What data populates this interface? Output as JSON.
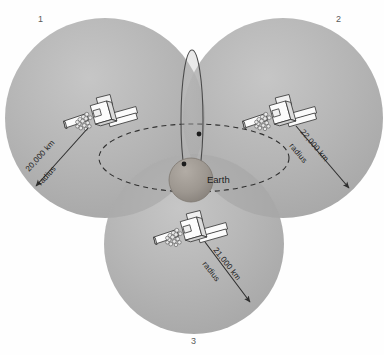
{
  "figure": {
    "background_color": "#fefefe",
    "center_body_label": "Earth",
    "circle_fill_color": "#b3b3b3",
    "circle_overlap_color": "#a2a2a2",
    "earth_color": "#9a958f",
    "line_color": "#3c3c3c",
    "satellite_body_color": "#f2f2f2"
  },
  "coverage_circles": [
    {
      "id": "circle-1",
      "corner_number": "1",
      "radius_value": "20,000 km",
      "radius_unit_label": "radius",
      "center_x": 105,
      "center_y": 118,
      "radius_px": 100
    },
    {
      "id": "circle-2",
      "corner_number": "2",
      "radius_value": "22,000 km",
      "radius_unit_label": "radius",
      "center_x": 283,
      "center_y": 118,
      "radius_px": 100
    },
    {
      "id": "circle-3",
      "corner_number": "3",
      "radius_value": "21,000 km",
      "radius_unit_label": "radius",
      "center_x": 194,
      "center_y": 244,
      "radius_px": 90
    }
  ],
  "satellites": [
    {
      "id": "satellite-1",
      "belongs_to": "circle-1"
    },
    {
      "id": "satellite-2",
      "belongs_to": "circle-2"
    },
    {
      "id": "satellite-3",
      "belongs_to": "circle-3"
    }
  ],
  "orbits": [
    {
      "id": "polar-orbit",
      "style": "solid",
      "orientation": "vertical"
    },
    {
      "id": "equatorial-orbit",
      "style": "dashed",
      "orientation": "horizontal"
    }
  ],
  "icons": {
    "satellite": "satellite-icon",
    "earth": "earth-sphere-icon"
  }
}
